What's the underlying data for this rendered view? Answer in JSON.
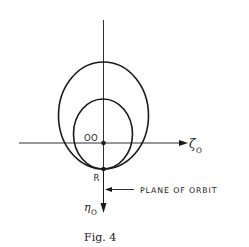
{
  "figure": {
    "caption": "Fig. 4",
    "labels": {
      "origin": "OO",
      "point": "R",
      "point_bar": "‾",
      "horizontal_axis": "ζ",
      "horizontal_axis_sub": "O",
      "vertical_axis": "η",
      "vertical_axis_sub": "O",
      "annotation": "PLANE OF ORBIT"
    },
    "colors": {
      "ink": "#1a1a1a",
      "background": "#ffffff"
    }
  }
}
